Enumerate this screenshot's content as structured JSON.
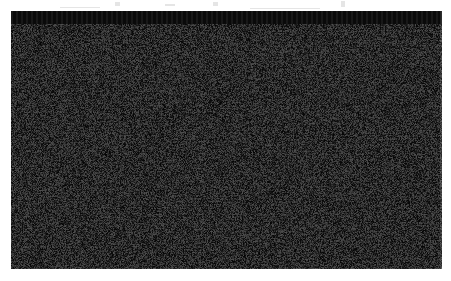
{
  "figure": {
    "kind": "satellite-nighttime-lights-map",
    "palette": {
      "background": "#ffffff",
      "plate_black": "#070707",
      "ocean_black": "#060606",
      "light_white": "#ffffff",
      "light_dim": "#8a8a8a"
    },
    "plate": {
      "x": 11,
      "y": 11,
      "width": 431,
      "height": 258
    },
    "caption": "",
    "annotations": []
  },
  "map_data": {
    "type": "raster-lights",
    "projection": "equirectangular-ish",
    "regions": [
      {
        "name": "Northeast Corridor",
        "brightness": "very-high"
      },
      {
        "name": "Great Lakes Industrial Belt",
        "brightness": "very-high"
      },
      {
        "name": "Southeast",
        "brightness": "high"
      },
      {
        "name": "Great Plains",
        "brightness": "medium-scattered"
      },
      {
        "name": "Mountain West",
        "brightness": "low"
      },
      {
        "name": "Pacific Coast",
        "brightness": "high"
      },
      {
        "name": "Great Lakes water bodies",
        "brightness": "none"
      },
      {
        "name": "Atlantic Ocean",
        "brightness": "none"
      },
      {
        "name": "Gulf of Mexico",
        "brightness": "none"
      }
    ],
    "bright_cities": [
      {
        "label": "Los Angeles",
        "x": 0.075,
        "y": 0.575,
        "intensity": 1.0
      },
      {
        "label": "San Diego",
        "x": 0.098,
        "y": 0.625,
        "intensity": 0.78
      },
      {
        "label": "San Francisco",
        "x": 0.04,
        "y": 0.43,
        "intensity": 0.88
      },
      {
        "label": "Sacramento",
        "x": 0.055,
        "y": 0.395,
        "intensity": 0.62
      },
      {
        "label": "Las Vegas",
        "x": 0.14,
        "y": 0.53,
        "intensity": 0.7
      },
      {
        "label": "Phoenix",
        "x": 0.175,
        "y": 0.625,
        "intensity": 0.8
      },
      {
        "label": "Seattle",
        "x": 0.055,
        "y": 0.095,
        "intensity": 0.8
      },
      {
        "label": "Portland",
        "x": 0.045,
        "y": 0.17,
        "intensity": 0.66
      },
      {
        "label": "Salt Lake City",
        "x": 0.195,
        "y": 0.37,
        "intensity": 0.66
      },
      {
        "label": "Denver",
        "x": 0.285,
        "y": 0.425,
        "intensity": 0.86
      },
      {
        "label": "Albuquerque",
        "x": 0.255,
        "y": 0.585,
        "intensity": 0.58
      },
      {
        "label": "El Paso",
        "x": 0.258,
        "y": 0.675,
        "intensity": 0.6
      },
      {
        "label": "Dallas",
        "x": 0.408,
        "y": 0.66,
        "intensity": 0.95
      },
      {
        "label": "Houston",
        "x": 0.44,
        "y": 0.735,
        "intensity": 0.92
      },
      {
        "label": "San Antonio",
        "x": 0.385,
        "y": 0.74,
        "intensity": 0.72
      },
      {
        "label": "Oklahoma City",
        "x": 0.398,
        "y": 0.57,
        "intensity": 0.66
      },
      {
        "label": "Kansas City",
        "x": 0.448,
        "y": 0.455,
        "intensity": 0.72
      },
      {
        "label": "Omaha",
        "x": 0.418,
        "y": 0.39,
        "intensity": 0.62
      },
      {
        "label": "Minneapolis",
        "x": 0.468,
        "y": 0.23,
        "intensity": 0.92
      },
      {
        "label": "Chicago",
        "x": 0.57,
        "y": 0.345,
        "intensity": 1.0
      },
      {
        "label": "St. Louis",
        "x": 0.52,
        "y": 0.47,
        "intensity": 0.82
      },
      {
        "label": "Memphis",
        "x": 0.52,
        "y": 0.57,
        "intensity": 0.66
      },
      {
        "label": "New Orleans",
        "x": 0.505,
        "y": 0.735,
        "intensity": 0.74
      },
      {
        "label": "Atlanta",
        "x": 0.625,
        "y": 0.6,
        "intensity": 0.84
      },
      {
        "label": "Detroit",
        "x": 0.64,
        "y": 0.32,
        "intensity": 0.88
      },
      {
        "label": "Cleveland",
        "x": 0.665,
        "y": 0.345,
        "intensity": 0.8
      },
      {
        "label": "Pittsburgh",
        "x": 0.7,
        "y": 0.375,
        "intensity": 0.74
      },
      {
        "label": "Washington DC",
        "x": 0.76,
        "y": 0.42,
        "intensity": 0.88
      },
      {
        "label": "Philadelphia",
        "x": 0.785,
        "y": 0.37,
        "intensity": 0.92
      },
      {
        "label": "New York",
        "x": 0.805,
        "y": 0.33,
        "intensity": 1.0
      },
      {
        "label": "Boston",
        "x": 0.845,
        "y": 0.27,
        "intensity": 0.94
      },
      {
        "label": "Miami",
        "x": 0.76,
        "y": 0.88,
        "intensity": 0.82
      },
      {
        "label": "Tampa",
        "x": 0.723,
        "y": 0.83,
        "intensity": 0.7
      },
      {
        "label": "Charlotte",
        "x": 0.7,
        "y": 0.545,
        "intensity": 0.6
      },
      {
        "label": "Nashville",
        "x": 0.59,
        "y": 0.54,
        "intensity": 0.58
      }
    ],
    "dark_water_bodies": [
      {
        "name": "Lake Superior"
      },
      {
        "name": "Lake Michigan"
      },
      {
        "name": "Lake Huron"
      },
      {
        "name": "Lake Erie"
      },
      {
        "name": "Lake Ontario"
      }
    ]
  }
}
